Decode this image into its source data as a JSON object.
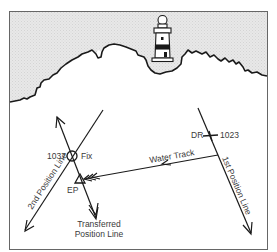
{
  "diagram": {
    "type": "navigation-running-fix",
    "colors": {
      "land": "#e6e6e6",
      "sea": "#ffffff",
      "ink": "#1a1a1a",
      "label": "#3a3a3a",
      "frame": "#555555"
    },
    "labels": {
      "fix_time": "1037",
      "fix": "Fix",
      "dr": "DR",
      "dr_time": "1023",
      "water_track": "Water Track",
      "first_position_line": "1st Position Line",
      "second_position_line": "2nd Position Line",
      "ep": "EP",
      "transferred_line_1": "Transferred",
      "transferred_line_2": "Position Line"
    },
    "icons": {
      "landmark": "lighthouse-icon",
      "fix_symbol": "circle-fix-icon",
      "ep_symbol": "triangle-ep-icon",
      "dr_symbol": "cross-dr-icon"
    }
  }
}
